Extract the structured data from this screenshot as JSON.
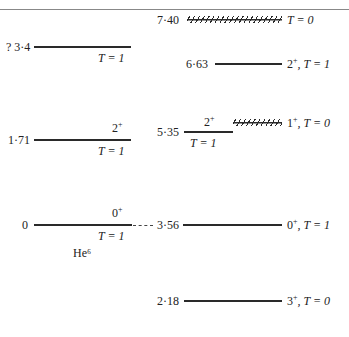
{
  "header": {
    "cropped_title": ""
  },
  "nuclei": {
    "left": {
      "label": "He⁶",
      "levels": [
        {
          "energy": "? 3·4",
          "jp": "",
          "isospin": "T = 1"
        },
        {
          "energy": "1·71",
          "jp": "2",
          "parity": "+",
          "isospin": "T = 1"
        },
        {
          "energy": "0",
          "jp": "0",
          "parity": "+",
          "isospin": "T = 1"
        }
      ]
    },
    "right": {
      "levels": [
        {
          "energy": "7·40",
          "style": "hatched",
          "isospin": "T = 0"
        },
        {
          "energy": "6·63",
          "jp": "2",
          "parity": "+",
          "isospin": ", T = 1"
        },
        {
          "energy": "5·35",
          "jp": "2",
          "parity": "+",
          "isospin": "T = 1",
          "companion": {
            "jp": "1",
            "parity": "+",
            "isospin": ", T = 0",
            "style": "hatched"
          }
        },
        {
          "energy": "3·56",
          "jp": "0",
          "parity": "+",
          "isospin": ", T = 1"
        },
        {
          "energy": "2·18",
          "jp": "3",
          "parity": "+",
          "isospin": ", T = 0"
        }
      ]
    }
  }
}
